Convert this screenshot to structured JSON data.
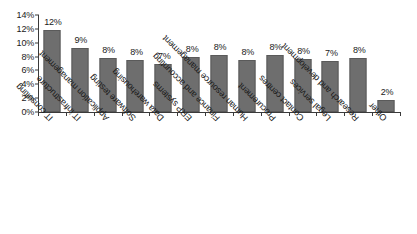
{
  "chart_data": {
    "type": "bar",
    "title": "",
    "subtitle": "",
    "xlabel": "",
    "ylabel": "",
    "ylim": [
      0,
      14
    ],
    "ytick_labels": [
      "0%",
      "2%",
      "4%",
      "6%",
      "8%",
      "10%",
      "12%",
      "14%"
    ],
    "ytick_values": [
      0,
      2,
      4,
      6,
      8,
      10,
      12,
      14
    ],
    "grid": false,
    "legend": false,
    "legend_position": "none",
    "bar_color": "#6e6e6e",
    "axis_color": "#3a3a3a",
    "background": "#ffffff",
    "value_label_suffix": "%",
    "categories": [
      "IT consulting",
      "IT infrastructure",
      "Application management",
      "Software testing",
      "Data warehousing",
      "ERP systems",
      "Finance and accounting",
      "Human resource management",
      "Procurement",
      "Contact centres",
      "Legal services",
      "Research and development",
      "Other"
    ],
    "values": [
      11.9,
      9.3,
      7.8,
      7.5,
      6.9,
      8.0,
      8.2,
      7.5,
      8.2,
      7.7,
      7.4,
      7.8,
      1.7
    ],
    "value_labels": [
      "12%",
      "9%",
      "8%",
      "8%",
      "7%",
      "8%",
      "8%",
      "8%",
      "8%",
      "8%",
      "7%",
      "8%",
      "2%"
    ]
  }
}
